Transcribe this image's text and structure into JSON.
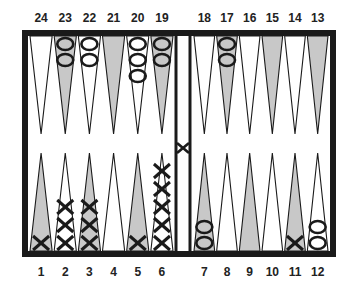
{
  "colors": {
    "border": "#1a1a1a",
    "shaded_point": "#c8c8c8",
    "light_point": "#ffffff",
    "checker_stroke": "#1a1a1a"
  },
  "top_labels": [
    "24",
    "23",
    "22",
    "21",
    "20",
    "19",
    "18",
    "17",
    "16",
    "15",
    "14",
    "13"
  ],
  "bottom_labels": [
    "1",
    "2",
    "3",
    "4",
    "5",
    "6",
    "7",
    "8",
    "9",
    "10",
    "11",
    "12"
  ],
  "points": [
    {
      "n": 1,
      "checkers": {
        "type": "X",
        "count": 1
      }
    },
    {
      "n": 2,
      "checkers": {
        "type": "X",
        "count": 3
      }
    },
    {
      "n": 3,
      "checkers": {
        "type": "X",
        "count": 3
      }
    },
    {
      "n": 4,
      "checkers": {
        "type": null,
        "count": 0
      }
    },
    {
      "n": 5,
      "checkers": {
        "type": "X",
        "count": 1
      }
    },
    {
      "n": 6,
      "checkers": {
        "type": "X",
        "count": 5
      }
    },
    {
      "n": 7,
      "checkers": {
        "type": "O",
        "count": 2
      }
    },
    {
      "n": 8,
      "checkers": {
        "type": null,
        "count": 0
      }
    },
    {
      "n": 9,
      "checkers": {
        "type": null,
        "count": 0
      }
    },
    {
      "n": 10,
      "checkers": {
        "type": null,
        "count": 0
      }
    },
    {
      "n": 11,
      "checkers": {
        "type": "X",
        "count": 1
      }
    },
    {
      "n": 12,
      "checkers": {
        "type": "O",
        "count": 2
      }
    },
    {
      "n": 13,
      "checkers": {
        "type": null,
        "count": 0
      }
    },
    {
      "n": 14,
      "checkers": {
        "type": null,
        "count": 0
      }
    },
    {
      "n": 15,
      "checkers": {
        "type": null,
        "count": 0
      }
    },
    {
      "n": 16,
      "checkers": {
        "type": null,
        "count": 0
      }
    },
    {
      "n": 17,
      "checkers": {
        "type": "O",
        "count": 2
      }
    },
    {
      "n": 18,
      "checkers": {
        "type": null,
        "count": 0
      }
    },
    {
      "n": 19,
      "checkers": {
        "type": "O",
        "count": 2
      }
    },
    {
      "n": 20,
      "checkers": {
        "type": "O",
        "count": 3
      }
    },
    {
      "n": 21,
      "checkers": {
        "type": null,
        "count": 0
      }
    },
    {
      "n": 22,
      "checkers": {
        "type": "O",
        "count": 2
      }
    },
    {
      "n": 23,
      "checkers": {
        "type": "O",
        "count": 2
      }
    },
    {
      "n": 24,
      "checkers": {
        "type": null,
        "count": 0
      }
    }
  ],
  "bar": {
    "checkers": [
      {
        "type": "X",
        "count": 1
      }
    ]
  }
}
